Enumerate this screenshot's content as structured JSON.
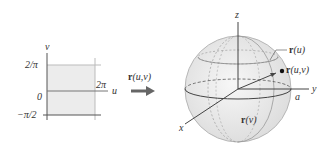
{
  "domain_graph": {
    "axis_u_label": "u",
    "axis_v_label": "v",
    "tick_top": "2/π",
    "tick_zero": "0",
    "tick_bottom": "−π/2",
    "tick_u_right": "2π",
    "region_color": "#ececec"
  },
  "mapping": {
    "label_r": "r",
    "label_args": "(u,v)"
  },
  "sphere": {
    "axis_x_label": "x",
    "axis_y_label": "y",
    "axis_z_label": "z",
    "radius_label": "a",
    "curve_u_label_r": "r",
    "curve_u_label_args": "(u)",
    "curve_v_label_r": "r",
    "curve_v_label_args": "(v)",
    "point_label_r": "r",
    "point_label_args": "(u,v)",
    "fill_color": "#e9e9e9"
  }
}
